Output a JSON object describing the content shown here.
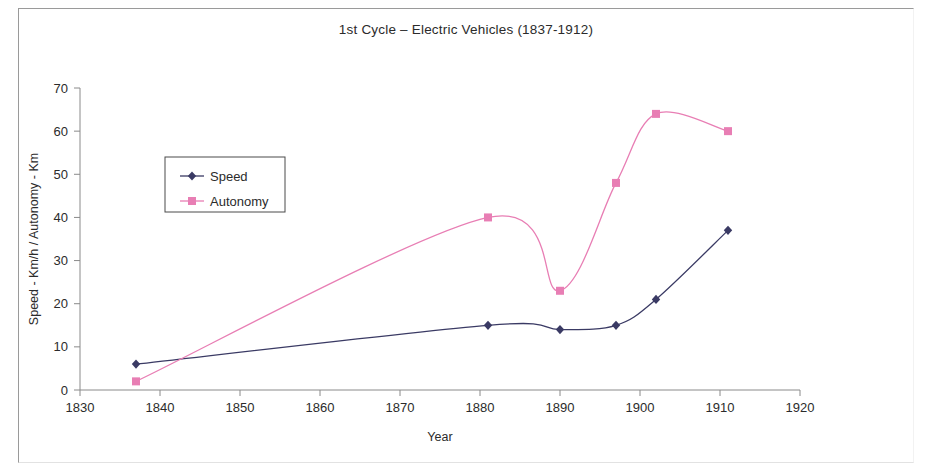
{
  "figure": {
    "title": "1st Cycle – Electric Vehicles  (1837-1912)",
    "background_color": "#ffffff",
    "frame_color": "#9a9a9a"
  },
  "chart_data": {
    "type": "line",
    "title": "1st Cycle – Electric Vehicles  (1837-1912)",
    "xlabel": "Year",
    "ylabel": "Speed - Km/h / Autonomy - Km",
    "xlim": [
      1830,
      1920
    ],
    "ylim": [
      0,
      70
    ],
    "xticks": [
      1830,
      1840,
      1850,
      1860,
      1870,
      1880,
      1890,
      1900,
      1910,
      1920
    ],
    "yticks": [
      0,
      10,
      20,
      30,
      40,
      50,
      60,
      70
    ],
    "grid": false,
    "legend_position": "upper-left-inside",
    "x": [
      1837,
      1881,
      1890,
      1897,
      1902,
      1911
    ],
    "series": [
      {
        "name": "Speed",
        "color": "#3a3a64",
        "marker": "diamond",
        "values": [
          6,
          15,
          14,
          15,
          21,
          37
        ]
      },
      {
        "name": "Autonomy",
        "color": "#e87eb4",
        "marker": "square",
        "values": [
          2,
          40,
          23,
          48,
          64,
          60
        ]
      }
    ]
  },
  "legend": {
    "items": [
      {
        "label": "Speed",
        "color": "#3a3a64",
        "marker": "diamond"
      },
      {
        "label": "Autonomy",
        "color": "#e87eb4",
        "marker": "square"
      }
    ]
  },
  "axis_labels": {
    "x_ticks": [
      "1830",
      "1840",
      "1850",
      "1860",
      "1870",
      "1880",
      "1890",
      "1900",
      "1910",
      "1920"
    ],
    "y_ticks": [
      "0",
      "10",
      "20",
      "30",
      "40",
      "50",
      "60",
      "70"
    ],
    "x_title": "Year",
    "y_title": "Speed - Km/h / Autonomy - Km"
  }
}
